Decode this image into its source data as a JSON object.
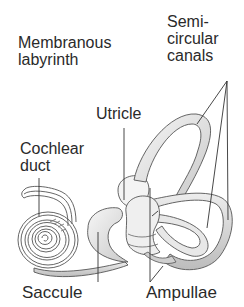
{
  "diagram": {
    "title": "Membranous labyrinth",
    "labels": {
      "membranous_labyrinth": "Membranous\nlabyrinth",
      "semicircular_canals": "Semi-\ncircular\ncanals",
      "utricle": "Utricle",
      "cochlear_duct": "Cochlear\nduct",
      "saccule": "Saccule",
      "ampullae": "Ampullae"
    },
    "colors": {
      "outline": "#555555",
      "fill_light": "#efefef",
      "fill_mid": "#d6d6d6",
      "fill_dark": "#b8b8b8",
      "text": "#2a2a2a",
      "leader": "#333333"
    }
  }
}
